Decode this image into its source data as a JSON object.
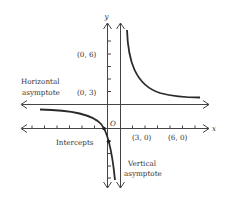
{
  "figure": {
    "axis_labels": {
      "x": "x",
      "y": "y",
      "origin": "O"
    },
    "points": {
      "y6": "(0, 6)",
      "y3": "(0, 3)",
      "x3": "(3, 0)",
      "x6": "(6, 0)"
    },
    "annotations": {
      "horizontal_line1": "Horizontal",
      "horizontal_line2": "asymptote",
      "intercepts": "Intercepts",
      "vertical_line1": "Vertical",
      "vertical_line2": "asymptote"
    },
    "colors": {
      "ink": "#333333",
      "curve": "#2a2a2a"
    }
  }
}
